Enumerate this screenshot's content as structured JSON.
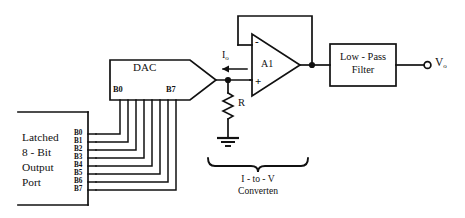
{
  "diagram": {
    "ink_color": "#111111",
    "background": "#ffffff"
  },
  "port": {
    "name": "latched-8-bit-output-port",
    "lines": [
      "Latched",
      "8 - Bit",
      "Output",
      "Port"
    ],
    "pins": [
      "B0",
      "B1",
      "B2",
      "B3",
      "B4",
      "B5",
      "B6",
      "B7"
    ]
  },
  "dac": {
    "label": "DAC",
    "pin_first": "B0",
    "pin_last": "B7",
    "pin_count": 8
  },
  "current": {
    "label": "I",
    "subscript": "o",
    "direction": "left"
  },
  "resistor": {
    "label": "R"
  },
  "opamp": {
    "label": "A1",
    "inverting": "-",
    "noninverting": "+"
  },
  "filter": {
    "line1": "Low - Pass",
    "line2": "Filter"
  },
  "output": {
    "label": "V",
    "subscript": "o"
  },
  "converter": {
    "line1": "I - to - V",
    "line2": "Converten"
  }
}
